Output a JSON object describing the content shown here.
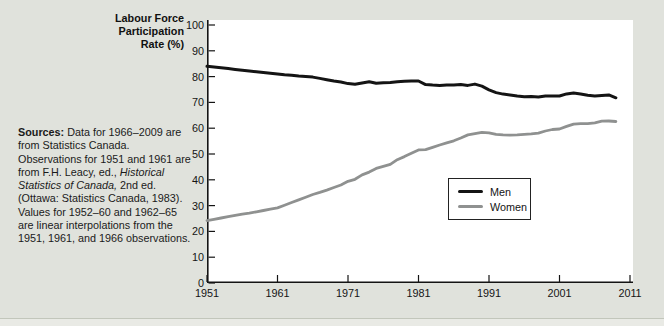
{
  "figure": {
    "background": "#e0e2dc",
    "plot_background": "#ffffff",
    "axis_color": "#141414",
    "divider_color": "#c2c6bb"
  },
  "axis_title": {
    "lines": [
      "Labour Force",
      "Participation",
      "Rate (%)"
    ]
  },
  "sources": {
    "segments": [
      {
        "text": "Sources:",
        "style": "bold"
      },
      {
        "text": " Data for 1966–2009 are from Statistics Canada. Observations for 1951 and 1961 are from F.H. Leacy, ed., ",
        "style": "normal"
      },
      {
        "text": "Historical Statistics of Canada,",
        "style": "italic"
      },
      {
        "text": " 2nd ed. (Ottawa: Statistics Canada, 1983). Values for 1952–60 and 1962–65 are linear interpolations from the 1951, 1961, and 1966 observations.",
        "style": "normal"
      }
    ]
  },
  "legend": {
    "items": [
      {
        "label": "Men",
        "color": "#141414"
      },
      {
        "label": "Women",
        "color": "#8f9190"
      }
    ]
  },
  "chart_data": {
    "type": "line",
    "title": "",
    "xlabel": "",
    "ylabel": "Labour Force Participation Rate (%)",
    "xlim": [
      1951,
      2011
    ],
    "ylim": [
      0,
      100
    ],
    "grid": false,
    "legend_position": "inside lower-right",
    "x_ticks": [
      1951,
      1961,
      1971,
      1981,
      1991,
      2001,
      2011
    ],
    "y_ticks": [
      0,
      10,
      20,
      30,
      40,
      50,
      60,
      70,
      80,
      90,
      100
    ],
    "x": [
      1951,
      1952,
      1953,
      1954,
      1955,
      1956,
      1957,
      1958,
      1959,
      1960,
      1961,
      1962,
      1963,
      1964,
      1965,
      1966,
      1967,
      1968,
      1969,
      1970,
      1971,
      1972,
      1973,
      1974,
      1975,
      1976,
      1977,
      1978,
      1979,
      1980,
      1981,
      1982,
      1983,
      1984,
      1985,
      1986,
      1987,
      1988,
      1989,
      1990,
      1991,
      1992,
      1993,
      1994,
      1995,
      1996,
      1997,
      1998,
      1999,
      2000,
      2001,
      2002,
      2003,
      2004,
      2005,
      2006,
      2007,
      2008,
      2009
    ],
    "series": [
      {
        "name": "Men",
        "color": "#141414",
        "stroke_width": 3,
        "values": [
          84.0,
          83.7,
          83.4,
          83.1,
          82.8,
          82.5,
          82.2,
          81.9,
          81.6,
          81.3,
          81.0,
          80.7,
          80.5,
          80.2,
          80.0,
          79.8,
          79.3,
          78.8,
          78.3,
          77.9,
          77.3,
          77.0,
          77.5,
          78.0,
          77.4,
          77.6,
          77.7,
          78.0,
          78.2,
          78.3,
          78.3,
          76.9,
          76.7,
          76.6,
          76.7,
          76.7,
          76.9,
          76.6,
          77.1,
          76.3,
          74.9,
          73.8,
          73.2,
          72.9,
          72.5,
          72.2,
          72.3,
          72.1,
          72.5,
          72.5,
          72.5,
          73.3,
          73.6,
          73.3,
          72.8,
          72.5,
          72.7,
          72.9,
          71.8
        ]
      },
      {
        "name": "Women",
        "color": "#8f9190",
        "stroke_width": 2.8,
        "values": [
          24.2,
          24.7,
          25.2,
          25.7,
          26.2,
          26.7,
          27.1,
          27.6,
          28.1,
          28.6,
          29.1,
          30.1,
          31.2,
          32.2,
          33.2,
          34.3,
          35.1,
          36.0,
          37.0,
          38.0,
          39.4,
          40.2,
          41.9,
          43.0,
          44.4,
          45.2,
          46.0,
          47.8,
          49.0,
          50.3,
          51.6,
          51.7,
          52.6,
          53.5,
          54.3,
          55.1,
          56.2,
          57.4,
          57.9,
          58.4,
          58.2,
          57.6,
          57.4,
          57.3,
          57.4,
          57.6,
          57.8,
          58.1,
          58.9,
          59.5,
          59.7,
          60.7,
          61.6,
          61.8,
          61.8,
          62.1,
          62.7,
          62.8,
          62.6
        ]
      }
    ]
  }
}
